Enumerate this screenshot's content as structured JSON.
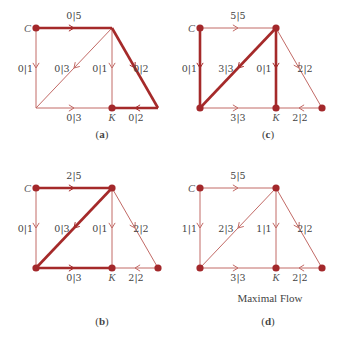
{
  "colors": {
    "thin_edge": "#c26a66",
    "thick_edge": "#a52a2a",
    "node": "#a3282b",
    "text": "#444444"
  },
  "panels": [
    {
      "id": "a",
      "caption_letter": "a",
      "origin": [
        36,
        28
      ],
      "caption_pos": [
        102,
        138
      ],
      "nodes": {
        "C": "C",
        "K": "K"
      },
      "edges": {
        "top": {
          "label": "0|5",
          "thick": true
        },
        "left": {
          "label": "0|1",
          "thick": false
        },
        "diag": {
          "label": "0|3",
          "thick": false
        },
        "mid": {
          "label": "0|1",
          "thick": false
        },
        "right": {
          "label": "0|2",
          "thick": true
        },
        "bottom": {
          "label": "0|3",
          "thick": false
        },
        "br": {
          "label": "0|2",
          "thick": true
        }
      },
      "dots": [
        "C",
        "K"
      ]
    },
    {
      "id": "c",
      "caption_letter": "c",
      "origin": [
        200,
        28
      ],
      "caption_pos": [
        268,
        138
      ],
      "nodes": {
        "C": "C",
        "K": "K"
      },
      "edges": {
        "top": {
          "label": "5|5",
          "thick": false
        },
        "left": {
          "label": "0|1",
          "thick": true
        },
        "diag": {
          "label": "3|3",
          "thick": true
        },
        "mid": {
          "label": "0|1",
          "thick": true
        },
        "right": {
          "label": "2|2",
          "thick": false
        },
        "bottom": {
          "label": "3|3",
          "thick": false
        },
        "br": {
          "label": "2|2",
          "thick": false
        }
      },
      "dots": [
        "C",
        "TR",
        "BL",
        "K",
        "R"
      ]
    },
    {
      "id": "b",
      "caption_letter": "b",
      "origin": [
        36,
        188
      ],
      "caption_pos": [
        102,
        325
      ],
      "nodes": {
        "C": "C",
        "K": "K"
      },
      "edges": {
        "top": {
          "label": "2|5",
          "thick": true
        },
        "left": {
          "label": "0|1",
          "thick": false
        },
        "diag": {
          "label": "0|3",
          "thick": true
        },
        "mid": {
          "label": "0|1",
          "thick": false
        },
        "right": {
          "label": "2|2",
          "thick": false
        },
        "bottom": {
          "label": "0|3",
          "thick": true
        },
        "br": {
          "label": "2|2",
          "thick": false
        }
      },
      "dots": [
        "C",
        "TR",
        "BL",
        "K",
        "R"
      ]
    },
    {
      "id": "d",
      "caption_letter": "d",
      "origin": [
        200,
        188
      ],
      "caption_pos": [
        268,
        325
      ],
      "title": "Maximal Flow",
      "title_pos": [
        270,
        302
      ],
      "nodes": {
        "C": "C",
        "K": "K"
      },
      "edges": {
        "top": {
          "label": "5|5",
          "thick": false
        },
        "left": {
          "label": "1|1",
          "thick": false
        },
        "diag": {
          "label": "2|3",
          "thick": false
        },
        "mid": {
          "label": "1|1",
          "thick": false
        },
        "right": {
          "label": "2|2",
          "thick": false
        },
        "bottom": {
          "label": "3|3",
          "thick": false
        },
        "br": {
          "label": "2|2",
          "thick": false
        }
      },
      "dots": [
        "C",
        "TR",
        "BL",
        "K",
        "R"
      ]
    }
  ]
}
